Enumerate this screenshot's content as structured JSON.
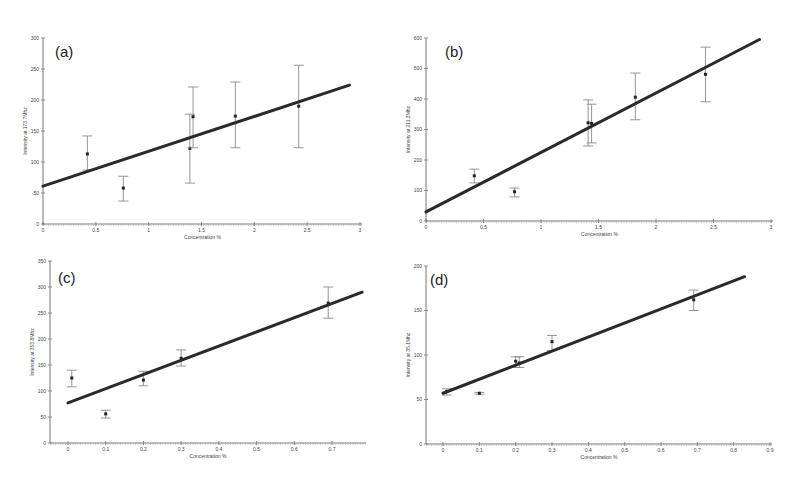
{
  "figure": {
    "width": 801,
    "height": 480,
    "colors": {
      "fit_line": "#2a2a2a",
      "error_bar": "#8a8a8a",
      "point": "#222222",
      "axis": "#777777"
    }
  },
  "chart_data": [
    {
      "id": "a",
      "type": "scatter",
      "panel_label": "(a)",
      "title": "",
      "xlabel": "Concentration %",
      "ylabel": "Intensity at 173.7Mhz",
      "xlim": [
        0,
        3
      ],
      "ylim": [
        0,
        300
      ],
      "xticks": [
        0,
        0.5,
        1,
        1.5,
        2,
        2.5,
        3
      ],
      "xtick_labels": [
        "0",
        "0.5",
        "1",
        "1.5",
        "2",
        "2.5",
        "3"
      ],
      "yticks": [
        0,
        50,
        100,
        150,
        200,
        250,
        300
      ],
      "ytick_labels": [
        "0",
        "50",
        "100",
        "150",
        "200",
        "250",
        "300"
      ],
      "grid": false,
      "points": [
        {
          "x": 0.42,
          "y": 113,
          "err_low": 87,
          "err_high": 142
        },
        {
          "x": 0.76,
          "y": 58,
          "err_low": 37,
          "err_high": 77
        },
        {
          "x": 1.39,
          "y": 122,
          "err_low": 66,
          "err_high": 177
        },
        {
          "x": 1.42,
          "y": 173,
          "err_low": 123,
          "err_high": 221
        },
        {
          "x": 1.82,
          "y": 174,
          "err_low": 123,
          "err_high": 229
        },
        {
          "x": 2.42,
          "y": 190,
          "err_low": 123,
          "err_high": 256
        }
      ],
      "fit_line": {
        "x0": 0,
        "y0": 61,
        "x1": 2.9,
        "y1": 224
      },
      "layout": {
        "x0": 43,
        "x1": 360,
        "y0": 224,
        "y1": 38,
        "axis_end": 362,
        "label_x": 55,
        "label_y": 57
      }
    },
    {
      "id": "b",
      "type": "scatter",
      "panel_label": "(b)",
      "title": "",
      "xlabel": "Concentration %",
      "ylabel": "Intensity at 211.3Mhz",
      "xlim": [
        0,
        3
      ],
      "ylim": [
        0,
        600
      ],
      "xticks": [
        0,
        0.5,
        1,
        1.5,
        2,
        2.5,
        3
      ],
      "xtick_labels": [
        "0",
        "0.5",
        "1",
        "1.5",
        "2",
        "2.5",
        "3"
      ],
      "yticks": [
        0,
        100,
        200,
        300,
        400,
        500,
        600
      ],
      "ytick_labels": [
        "0",
        "100",
        "200",
        "300",
        "400",
        "500",
        "600"
      ],
      "grid": false,
      "points": [
        {
          "x": 0.42,
          "y": 148,
          "err_low": 125,
          "err_high": 170
        },
        {
          "x": 0.77,
          "y": 96,
          "err_low": 79,
          "err_high": 108
        },
        {
          "x": 1.41,
          "y": 322,
          "err_low": 246,
          "err_high": 397
        },
        {
          "x": 1.44,
          "y": 320,
          "err_low": 256,
          "err_high": 383
        },
        {
          "x": 1.82,
          "y": 406,
          "err_low": 332,
          "err_high": 485
        },
        {
          "x": 2.43,
          "y": 481,
          "err_low": 391,
          "err_high": 570
        }
      ],
      "fit_line": {
        "x0": 0,
        "y0": 30,
        "x1": 2.9,
        "y1": 595
      },
      "layout": {
        "x0": 426,
        "x1": 771,
        "y0": 221,
        "y1": 38,
        "axis_end": 773,
        "label_x": 445,
        "label_y": 57
      }
    },
    {
      "id": "c",
      "type": "scatter",
      "panel_label": "(c)",
      "title": "",
      "xlabel": "Concentration %",
      "ylabel": "Intensity at 353.8Mhz",
      "xlim": [
        0,
        0.7
      ],
      "ylim": [
        0,
        350
      ],
      "xticks": [
        0,
        0.1,
        0.2,
        0.3,
        0.4,
        0.5,
        0.6,
        0.7
      ],
      "xtick_labels": [
        "0",
        "0.1",
        "0.2",
        "0.3",
        "0.4",
        "0.5",
        "0.6",
        "0.7"
      ],
      "yticks": [
        0,
        50,
        100,
        150,
        200,
        250,
        300,
        350
      ],
      "ytick_labels": [
        "0",
        "50",
        "100",
        "150",
        "200",
        "250",
        "300",
        "350"
      ],
      "grid": false,
      "points": [
        {
          "x": 0.01,
          "y": 125,
          "err_low": 108,
          "err_high": 140
        },
        {
          "x": 0.1,
          "y": 56,
          "err_low": 48,
          "err_high": 63
        },
        {
          "x": 0.2,
          "y": 121,
          "err_low": 110,
          "err_high": 138
        },
        {
          "x": 0.3,
          "y": 163,
          "err_low": 148,
          "err_high": 179
        },
        {
          "x": 0.69,
          "y": 269,
          "err_low": 240,
          "err_high": 300
        }
      ],
      "fit_line": {
        "x0": 0,
        "y0": 77,
        "x1": 0.78,
        "y1": 290
      },
      "layout": {
        "x0": 68,
        "x1": 332,
        "y0": 443,
        "y1": 261,
        "axis_origin": 50,
        "axis_end": 366,
        "label_x": 58,
        "label_y": 283
      }
    },
    {
      "id": "d",
      "type": "scatter",
      "panel_label": "(d)",
      "title": "",
      "xlabel": "Concentration %",
      "ylabel": "Intensity at 35.1Mhz",
      "xlim": [
        0,
        0.9
      ],
      "ylim": [
        0,
        200
      ],
      "xticks": [
        0,
        0.1,
        0.2,
        0.3,
        0.4,
        0.5,
        0.6,
        0.7,
        0.8,
        0.9
      ],
      "xtick_labels": [
        "0",
        "0.1",
        "0.2",
        "0.3",
        "0.4",
        "0.5",
        "0.6",
        "0.7",
        "0.8",
        "0.9"
      ],
      "yticks": [
        0,
        50,
        100,
        150,
        200
      ],
      "ytick_labels": [
        "0",
        "50",
        "100",
        "150",
        "200"
      ],
      "grid": false,
      "points": [
        {
          "x": 0.01,
          "y": 59,
          "err_low": 55,
          "err_high": 62
        },
        {
          "x": 0.1,
          "y": 57,
          "err_low": 56,
          "err_high": 58
        },
        {
          "x": 0.2,
          "y": 93,
          "err_low": 86,
          "err_high": 98
        },
        {
          "x": 0.21,
          "y": 91,
          "err_low": 86,
          "err_high": 98
        },
        {
          "x": 0.3,
          "y": 115,
          "err_low": 105,
          "err_high": 122
        },
        {
          "x": 0.69,
          "y": 162,
          "err_low": 150,
          "err_high": 173
        }
      ],
      "fit_line": {
        "x0": 0,
        "y0": 57,
        "x1": 0.83,
        "y1": 188
      },
      "layout": {
        "x0": 443,
        "x1": 770,
        "y0": 444,
        "y1": 266,
        "axis_origin": 426,
        "axis_end": 772,
        "label_x": 430,
        "label_y": 285
      }
    }
  ]
}
